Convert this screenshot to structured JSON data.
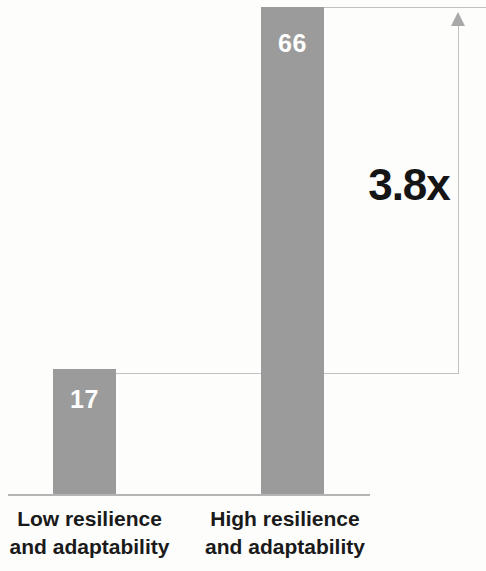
{
  "chart_data": {
    "type": "bar",
    "title": "",
    "subtitle": "",
    "xlabel": "",
    "ylabel": "",
    "categories": [
      "Low resilience and adaptability",
      "High resilience and adaptability"
    ],
    "values": [
      17,
      66
    ],
    "value_labels": [
      "17",
      "66"
    ],
    "ylim": [
      0,
      68
    ],
    "grid": false,
    "legend": null,
    "annotations": [
      {
        "type": "ratio-bracket",
        "label": "3.8x",
        "from_value": 17,
        "to_value": 66,
        "arrow": "up"
      }
    ],
    "colors": {
      "bar": "#9b9b9b",
      "value_label": "#ffffff",
      "annotation_text": "#151515",
      "axis": "#b4b4b4",
      "bracket": "#c2c2c2",
      "background": "#fdfdfc",
      "category_label": "#1a1a1a"
    }
  },
  "bars": [
    {
      "key": "low",
      "value_label": "17",
      "category_line1": "Low resilience",
      "category_line2": "and adaptability"
    },
    {
      "key": "high",
      "value_label": "66",
      "category_line1": "High resilience",
      "category_line2": "and adaptability"
    }
  ],
  "annotation": {
    "multiplier": "3.8x"
  }
}
